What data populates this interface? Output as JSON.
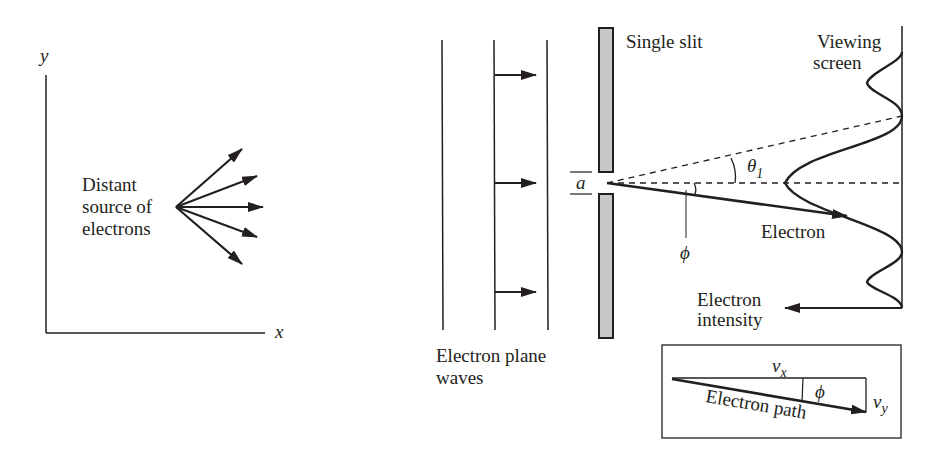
{
  "left_panel": {
    "y_axis_label": "y",
    "x_axis_label": "x",
    "source_label": [
      "Distant",
      "source of",
      "electrons"
    ],
    "arrow_count": 5
  },
  "right_panel": {
    "plane_waves_label": [
      "Electron plane",
      "waves"
    ],
    "single_slit_label": "Single slit",
    "viewing_screen_label": [
      "Viewing",
      "screen"
    ],
    "slit_width_label": "a",
    "theta_label": "θ",
    "theta_subscript": "1",
    "phi_label": "ϕ",
    "electron_label": "Electron",
    "intensity_label": [
      "Electron",
      "intensity"
    ]
  },
  "inset": {
    "vx_label": "v",
    "vx_subscript": "x",
    "vy_label": "v",
    "vy_subscript": "y",
    "phi_label": "ϕ",
    "path_label": "Electron path"
  },
  "colors": {
    "ink": "#231f20",
    "slit_fill": "#c8c8c8",
    "background": "#ffffff"
  }
}
